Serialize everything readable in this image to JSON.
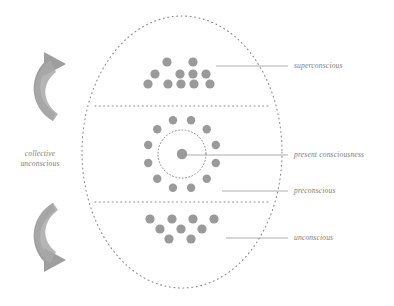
{
  "diagram": {
    "background_color": "#ffffff",
    "dot_color": "#9a9a9a",
    "line_color": "#8a8a8a",
    "text_color": "#7d7d7d",
    "arrow_color": "#9e9e9e",
    "outer_boundary": {
      "name": "psyche-ellipse",
      "style": "dotted",
      "cx": 182,
      "cy": 152,
      "rx": 100,
      "ry": 136
    },
    "dividers": [
      {
        "name": "superconscious-preconscious-divider",
        "y": 106,
        "style": "dotted"
      },
      {
        "name": "preconscious-unconscious-divider",
        "y": 202,
        "style": "dotted"
      }
    ],
    "labels": {
      "superconscious": "superconscious",
      "present_consciousness": "present consciousness",
      "preconscious": "preconscious",
      "unconscious": "unconscious",
      "collective_unconscious_line1": "collective",
      "collective_unconscious_line2": "unconscious"
    },
    "leader_lines": [
      {
        "name": "leader-superconscious",
        "x1": 216,
        "y1": 66,
        "x2": 288,
        "y2": 66
      },
      {
        "name": "leader-present-consciousness",
        "x1": 186,
        "y1": 155,
        "x2": 288,
        "y2": 155
      },
      {
        "name": "leader-preconscious",
        "x1": 222,
        "y1": 191,
        "x2": 288,
        "y2": 191
      },
      {
        "name": "leader-unconscious",
        "x1": 226,
        "y1": 238,
        "x2": 288,
        "y2": 238
      }
    ],
    "clusters": {
      "superconscious": {
        "name": "superconscious-dot-cluster",
        "layout": "pyramid",
        "dot_radius": 4.6,
        "rows": [
          {
            "count": 2,
            "y": 62,
            "xs": [
              167,
              193
            ]
          },
          {
            "count": 4,
            "y": 74,
            "xs": [
              155,
              180,
              193,
              206
            ]
          },
          {
            "count": 5,
            "y": 84,
            "xs": [
              148,
              168,
              181,
              194,
              210
            ]
          }
        ],
        "total_dots": 11
      },
      "present_consciousness": {
        "name": "present-consciousness-ring",
        "layout": "ring",
        "center": {
          "x": 182,
          "y": 154
        },
        "center_dot_radius": 5.2,
        "inner_circle_radius": 24,
        "inner_circle_style": "dotted",
        "ring_dot_radius": 4.2,
        "ring_dot_count": 12,
        "ring_radius": 35,
        "ring_start_angle_deg": -75
      },
      "unconscious": {
        "name": "unconscious-dot-cluster",
        "layout": "inverted-pyramid",
        "dot_radius": 4.6,
        "rows": [
          {
            "count": 4,
            "y": 219,
            "xs": [
              150,
              172,
              193,
              214
            ]
          },
          {
            "count": 3,
            "y": 229,
            "xs": [
              160,
              181,
              202
            ]
          },
          {
            "count": 2,
            "y": 239,
            "xs": [
              169,
              191
            ]
          }
        ],
        "total_dots": 9
      }
    },
    "arrows": [
      {
        "name": "collective-unconscious-arrow-top",
        "direction": "up-right",
        "tip": {
          "x": 64,
          "y": 70
        }
      },
      {
        "name": "collective-unconscious-arrow-bottom",
        "direction": "down-right",
        "tip": {
          "x": 64,
          "y": 254
        }
      }
    ]
  }
}
